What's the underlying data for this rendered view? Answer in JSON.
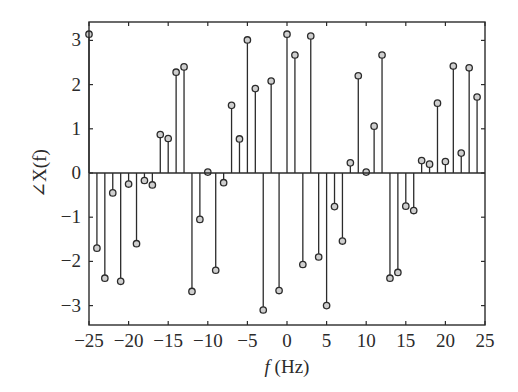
{
  "chart_data": {
    "type": "stem",
    "title": "",
    "xlabel_italic": "f",
    "xlabel_rest": " (Hz)",
    "xlabel": "f (Hz)",
    "ylabel": "∠X(f)",
    "xlim": [
      -25,
      25
    ],
    "ylim": [
      -3.4,
      3.4
    ],
    "xticks": [
      -25,
      -20,
      -15,
      -10,
      -5,
      0,
      5,
      10,
      15,
      20,
      25
    ],
    "xtick_labels": [
      "−25",
      "−20",
      "−15",
      "−10",
      "−5",
      "0",
      "5",
      "10",
      "15",
      "20",
      "25"
    ],
    "yticks": [
      -3,
      -2,
      -1,
      0,
      1,
      2,
      3
    ],
    "ytick_labels": [
      "−3",
      "−2",
      "−1",
      "0",
      "1",
      "2",
      "3"
    ],
    "grid": false,
    "legend": null,
    "x": [
      -25,
      -24,
      -23,
      -22,
      -21,
      -20,
      -19,
      -18,
      -17,
      -16,
      -15,
      -14,
      -13,
      -12,
      -11,
      -10,
      -9,
      -8,
      -7,
      -6,
      -5,
      -4,
      -3,
      -2,
      -1,
      0,
      1,
      2,
      3,
      4,
      5,
      6,
      7,
      8,
      9,
      10,
      11,
      12,
      13,
      14,
      15,
      16,
      17,
      18,
      19,
      20,
      21,
      22,
      23,
      24
    ],
    "values": [
      3.14,
      -1.7,
      -2.38,
      -0.45,
      -2.45,
      -0.25,
      -1.6,
      -0.17,
      -0.27,
      0.87,
      0.78,
      2.28,
      2.4,
      -2.68,
      -1.05,
      0.02,
      -2.2,
      -0.22,
      1.53,
      0.77,
      3.01,
      1.91,
      -3.1,
      2.08,
      -2.66,
      3.14,
      2.67,
      -2.07,
      3.1,
      -1.9,
      -3.0,
      -0.76,
      -1.54,
      0.23,
      2.2,
      0.02,
      1.06,
      2.67,
      -2.38,
      -2.25,
      -0.75,
      -0.85,
      0.28,
      0.2,
      1.58,
      0.26,
      2.42,
      0.45,
      2.38,
      1.72
    ]
  }
}
